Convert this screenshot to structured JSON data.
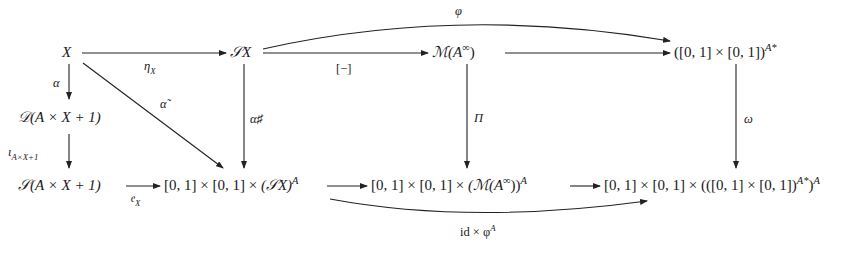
{
  "diagram": {
    "type": "commutative-diagram",
    "nodes": {
      "X": "X",
      "SX": "𝒮X",
      "MAinf": "ℳ(A^∞)",
      "pair_pow": "([0,1] × [0,1])^{A*}",
      "DAX1": "𝒟(A × X + 1)",
      "SAX1": "𝒮(A × X + 1)",
      "row2_SX": "[0,1] × [0,1] × (𝒮X)^A",
      "row2_M": "[0,1] × [0,1] × (ℳ(A^∞))^A",
      "row2_pair": "[0,1] × [0,1] × (([0,1] × [0,1])^{A*})^A"
    },
    "arrows": [
      {
        "from": "X",
        "to": "SX",
        "label": "η_X"
      },
      {
        "from": "SX",
        "to": "MAinf",
        "label": "[−]"
      },
      {
        "from": "MAinf",
        "to": "pair_pow",
        "label": ""
      },
      {
        "from": "SX",
        "to": "pair_pow",
        "label": "φ",
        "curved": "above"
      },
      {
        "from": "X",
        "to": "DAX1",
        "label": "α"
      },
      {
        "from": "X",
        "to": "row2_SX",
        "label": "α̃"
      },
      {
        "from": "DAX1",
        "to": "SAX1",
        "label": "ι_{A×X+1}"
      },
      {
        "from": "SAX1",
        "to": "row2_SX",
        "label": "𝔢_X"
      },
      {
        "from": "SX",
        "to": "row2_SX",
        "label": "α♯"
      },
      {
        "from": "MAinf",
        "to": "row2_M",
        "label": "Π"
      },
      {
        "from": "pair_pow",
        "to": "row2_pair",
        "label": "ω"
      },
      {
        "from": "row2_SX",
        "to": "row2_M",
        "label": ""
      },
      {
        "from": "row2_M",
        "to": "row2_pair",
        "label": ""
      },
      {
        "from": "row2_SX",
        "to": "row2_pair",
        "label": "id × φ^A",
        "curved": "below"
      }
    ]
  },
  "labels": {
    "X": "X",
    "SX_S": "𝒮",
    "SX_X": "X",
    "M": "ℳ(",
    "A": "A",
    "inf": "∞",
    "close": ")",
    "pair_open": "([0, 1] × [0, 1])",
    "Astar": "A*",
    "D": "𝒟(",
    "S": "𝒮(",
    "AX1": "A × X + 1)",
    "r2_prefix": "[0, 1] × [0, 1] × ",
    "r2a_body": "(𝒮X)",
    "r2b_body": "(ℳ(A",
    "r2b_close": "))",
    "r2c_body": "(([0, 1] × [0, 1])",
    "r2c_close": ")",
    "supA": "A",
    "eta": "η",
    "etaSub": "X",
    "bracket": "[−]",
    "phi": "φ",
    "alpha": "α",
    "alphaTilde": "α̃",
    "iota": "ι",
    "iotaSub": "A×X+1",
    "e": "𝔢",
    "eSub": "X",
    "alphaSharp": "α♯",
    "Pi": "Π",
    "omega": "ω",
    "idphi": "id × φ",
    "idphiSup": "A"
  }
}
